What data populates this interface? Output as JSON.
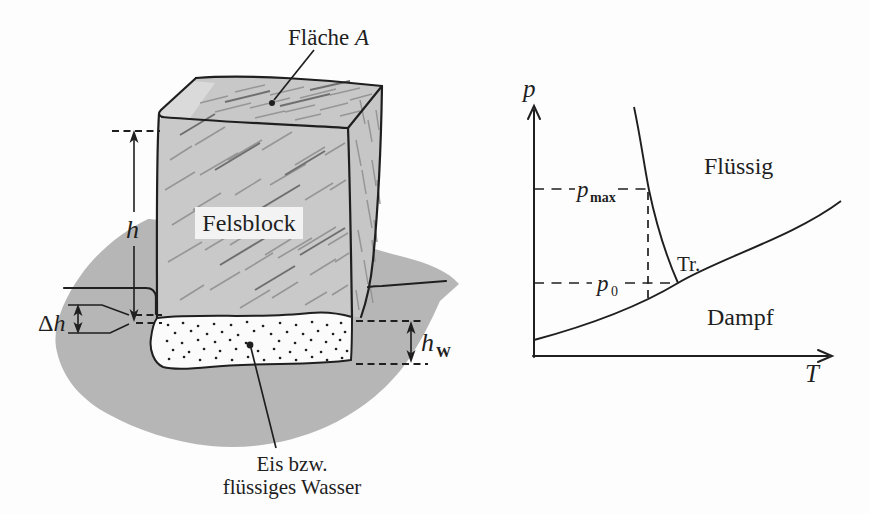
{
  "figure": {
    "left_panel": {
      "surface_label": {
        "text": "Fläche ",
        "symbol": "A"
      },
      "block_label": "Felsblock",
      "height_label": "h",
      "delta_height_label": {
        "delta": "Δ",
        "symbol": "h"
      },
      "water_height_label": {
        "symbol": "h",
        "sub": "W"
      },
      "ice_label": {
        "line1": "Eis bzw.",
        "line2": "flüssiges Wasser"
      }
    },
    "right_panel": {
      "pressure_axis_label": "p",
      "temperature_axis_label": "T",
      "pmax_label": {
        "symbol": "p",
        "sub": "max"
      },
      "p0_label": {
        "symbol": "p",
        "sub": "0"
      },
      "liquid_region_label": "Flüssig",
      "vapor_region_label": "Dampf",
      "triple_point_label": "Tr."
    }
  },
  "colors": {
    "background": "#fdfdfd",
    "ink": "#1f1f1f",
    "ground": "#b6b6b6",
    "block_front": "#c9c9c9",
    "block_top": "#c8c8c8",
    "block_side": "#c6c6c6",
    "block_top_highlight": "#dedede",
    "ice": "#fbfbfb",
    "label_box": "#f3f3f3",
    "hatch_dark": "#6f6f6f",
    "hatch_mid": "#969696"
  }
}
